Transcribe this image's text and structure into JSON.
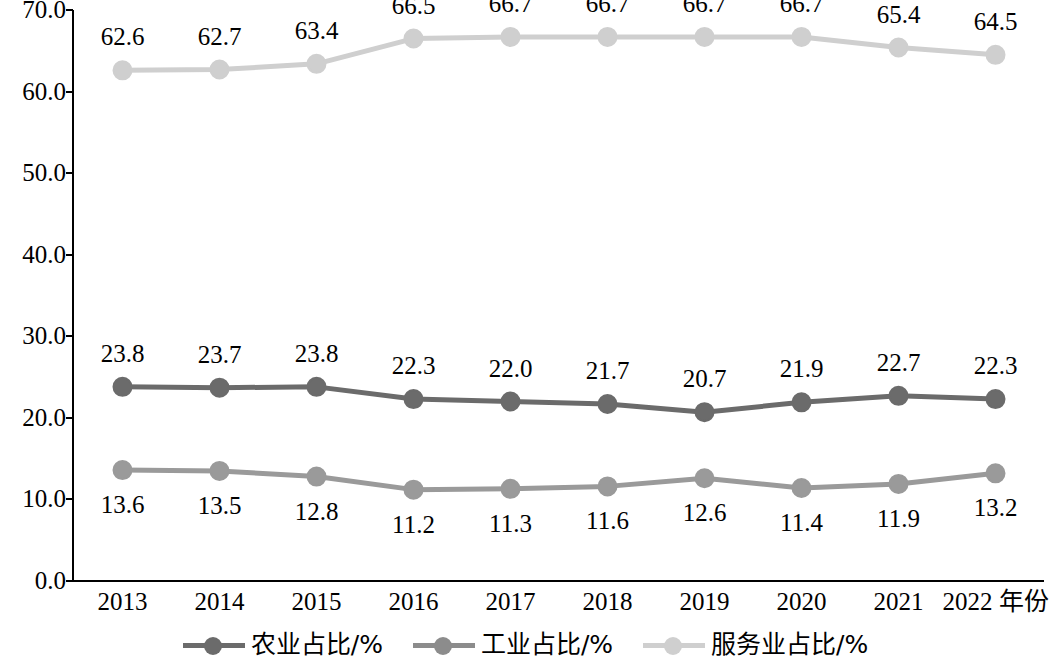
{
  "chart_data": {
    "type": "line",
    "title": "",
    "xlabel": "年份",
    "ylabel": "",
    "ylim": [
      0,
      70
    ],
    "yticks": [
      "0.0",
      "10.0",
      "20.0",
      "30.0",
      "40.0",
      "50.0",
      "60.0",
      "70.0"
    ],
    "ytick_values": [
      0,
      10,
      20,
      30,
      40,
      50,
      60,
      70
    ],
    "grid": false,
    "legend_position": "bottom",
    "categories": [
      "2013",
      "2014",
      "2015",
      "2016",
      "2017",
      "2018",
      "2019",
      "2020",
      "2021",
      "2022"
    ],
    "x_axis_suffix_label": "2022 年份",
    "series": [
      {
        "name": "农业占比/%",
        "color": "#9a9a9a",
        "values": [
          13.6,
          13.5,
          12.8,
          11.2,
          11.3,
          11.6,
          12.6,
          11.4,
          11.9,
          13.2
        ],
        "labels": [
          "13.6",
          "13.5",
          "12.8",
          "11.2",
          "11.3",
          "11.6",
          "12.6",
          "11.4",
          "11.9",
          "13.2"
        ],
        "label_position": "below"
      },
      {
        "name": "工业占比/%",
        "color": "#6b6b6b",
        "values": [
          23.8,
          23.7,
          23.8,
          22.3,
          22.0,
          21.7,
          20.7,
          21.9,
          22.7,
          22.3
        ],
        "labels": [
          "23.8",
          "23.7",
          "23.8",
          "22.3",
          "22.0",
          "21.7",
          "20.7",
          "21.9",
          "22.7",
          "22.3"
        ],
        "label_position": "above"
      },
      {
        "name": "服务业占比/%",
        "color": "#cfcfcf",
        "values": [
          62.6,
          62.7,
          63.4,
          66.5,
          66.7,
          66.7,
          66.7,
          66.7,
          65.4,
          64.5
        ],
        "labels": [
          "62.6",
          "62.7",
          "63.4",
          "66.5",
          "66.7",
          "66.7",
          "66.7",
          "66.7",
          "65.4",
          "64.5"
        ],
        "label_position": "above"
      }
    ],
    "legend": [
      {
        "label": "农业占比/%",
        "color": "#6b6b6b"
      },
      {
        "label": "工业占比/%",
        "color": "#8c8c8c"
      },
      {
        "label": "服务业占比/%",
        "color": "#cfcfcf"
      }
    ]
  }
}
